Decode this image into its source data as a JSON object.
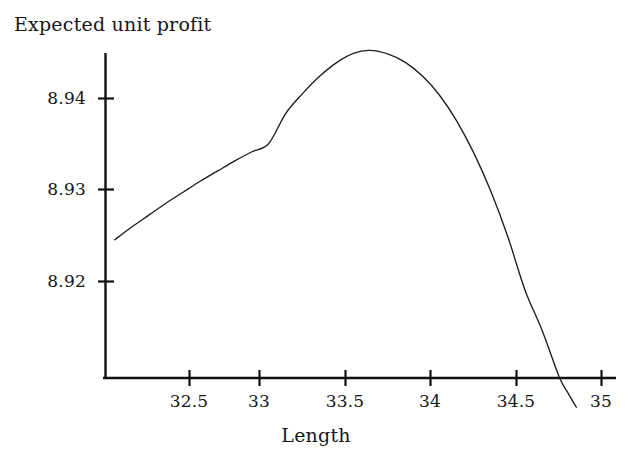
{
  "chart_data": {
    "type": "line",
    "title": "",
    "xlabel": "Length",
    "ylabel": "Expected unit profit",
    "xlim": [
      32.15,
      35.06
    ],
    "ylim": [
      8.9078,
      8.9455
    ],
    "grid": false,
    "legend": null,
    "xticks": [
      32.5,
      33,
      33.5,
      34,
      34.5,
      35
    ],
    "xtick_labels": [
      "32.5",
      "33",
      "33.5",
      "34",
      "34.5",
      "35"
    ],
    "yticks": [
      8.92,
      8.93,
      8.94
    ],
    "ytick_labels": [
      "8.92",
      "8.93",
      "8.94"
    ],
    "series": [
      {
        "name": "Expected unit profit",
        "x": [
          32.15,
          32.25,
          32.35,
          32.45,
          32.55,
          32.65,
          32.75,
          32.85,
          32.95,
          33.05,
          33.15,
          33.25,
          33.35,
          33.45,
          33.55,
          33.64,
          33.75,
          33.85,
          33.95,
          34.05,
          34.15,
          34.25,
          34.35,
          34.45,
          34.55,
          34.65,
          34.75,
          34.8,
          34.85
        ],
        "y": [
          8.9245,
          8.9259,
          8.9272,
          8.9285,
          8.9297,
          8.9309,
          8.932,
          8.9331,
          8.9341,
          8.935,
          8.9383,
          8.9405,
          8.9424,
          8.9439,
          8.9449,
          8.9452,
          8.9448,
          8.9439,
          8.9424,
          8.9403,
          8.9375,
          8.934,
          8.9298,
          8.9248,
          8.919,
          8.9146,
          8.9095,
          8.9078,
          8.9062
        ]
      }
    ],
    "curve_annotations": {
      "peak_x": 33.64,
      "peak_y": 8.9452,
      "start_x": 32.15,
      "start_y": 8.9245,
      "x_axis_crossing": 34.75
    }
  },
  "axis_label_y": "Expected unit profit",
  "axis_label_x": "Length",
  "ytick_labels": [
    "8.94",
    "8.93",
    "8.92"
  ],
  "xtick_labels": [
    "32.5",
    "33",
    "33.5",
    "34",
    "34.5",
    "35"
  ],
  "colors": {
    "curve": "#1d1d1d",
    "axis": "#111111",
    "background": "#ffffff",
    "text": "#161616"
  }
}
